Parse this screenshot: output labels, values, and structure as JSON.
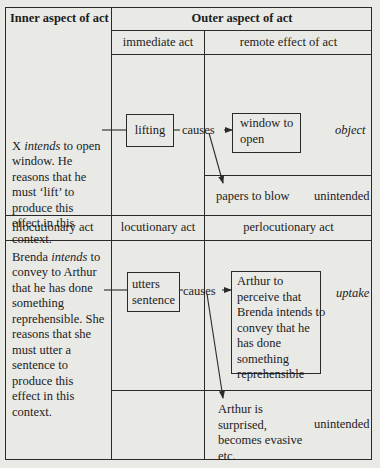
{
  "headers": {
    "inner": "Inner aspect of act",
    "outer": "Outer aspect of act",
    "immediate": "immediate act",
    "remote": "remote effect of act"
  },
  "example1": {
    "inner_text_line1_pre": "X ",
    "inner_text_line1_em": "intends",
    "inner_text_line1_post": " to open",
    "inner_text_rest": "window. He\nreasons that he\nmust ‘lift’ to\nproduce this\neffect in this\ncontext.",
    "act_box": "lifting",
    "causes": "causes",
    "effect_box": "window to\nopen",
    "effect_label": "object",
    "side_effect": "papers to blow",
    "side_label": "unintended"
  },
  "row2_headers": {
    "illocutionary": "illocutionary act",
    "locutionary": "locutionary act",
    "perlocutionary": "perlocutionary act"
  },
  "example2": {
    "inner_text_line1_pre": "Brenda ",
    "inner_text_line1_em": "intends",
    "inner_text_line1_post": " to",
    "inner_text_rest": "convey to Arthur\nthat he has done\nsomething\nreprehensible. She\nreasons that she\nmust utter a\nsentence to\nproduce this\neffect in this\ncontext.",
    "act_box": "utters\nsentence",
    "causes": "causes",
    "effect_box": "Arthur to\nperceive that\nBrenda intends to\nconvey that he\nhas done\nsomething\nreprehensible",
    "effect_label": "uptake",
    "side_effect": "Arthur is\nsurprised,\nbecomes evasive\netc.",
    "side_label": "unintended"
  }
}
